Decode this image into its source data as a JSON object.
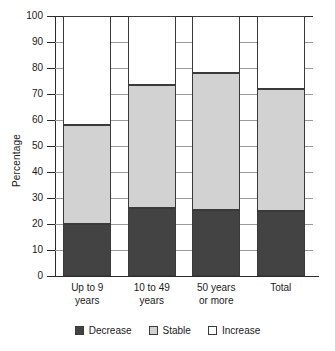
{
  "chart_data": {
    "type": "bar",
    "stacked": true,
    "title": "",
    "xlabel": "",
    "ylabel": "Percentage",
    "ylim": [
      0,
      100
    ],
    "yticks": [
      0,
      10,
      20,
      30,
      40,
      50,
      60,
      70,
      80,
      90,
      100
    ],
    "ytick_labels": [
      "0",
      "10",
      "20",
      "30",
      "40",
      "50",
      "60",
      "70",
      "80",
      "90",
      "100"
    ],
    "grid": true,
    "legend_position": "bottom",
    "categories": [
      [
        "Up to 9",
        "years"
      ],
      [
        "10 to 49",
        "years"
      ],
      [
        "50 years",
        "or more"
      ],
      [
        "Total",
        ""
      ]
    ],
    "category_labels": [
      "Up to 9 years",
      "10 to 49 years",
      "50 years or more",
      "Total"
    ],
    "series": [
      {
        "name": "Decrease",
        "color": "#434343",
        "values": [
          20,
          26,
          25.5,
          25
        ]
      },
      {
        "name": "Stable",
        "color": "#d2d2d2",
        "values": [
          38,
          47.5,
          52.5,
          47
        ]
      },
      {
        "name": "Increase",
        "color": "#ffffff",
        "values": [
          42,
          26.5,
          22,
          28
        ]
      }
    ],
    "cumulative_tops": [
      [
        20,
        58,
        100
      ],
      [
        26,
        73.5,
        100
      ],
      [
        25.5,
        78,
        100
      ],
      [
        25,
        72,
        100
      ]
    ]
  },
  "legend": {
    "items": [
      {
        "label": "Decrease",
        "color": "#434343"
      },
      {
        "label": "Stable",
        "color": "#d2d2d2"
      },
      {
        "label": "Increase",
        "color": "#ffffff"
      }
    ]
  }
}
